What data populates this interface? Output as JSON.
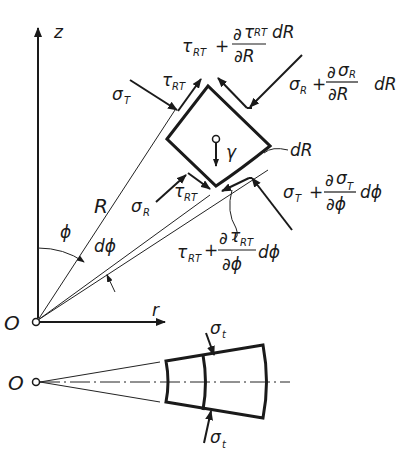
{
  "diagram": {
    "axes": {
      "z_label": "z",
      "r_label": "r",
      "origin_label": "O"
    },
    "radius_label": "R",
    "angle_label": "ϕ",
    "dangle_label": "dϕ",
    "body_force_label": "γ",
    "element_width_label": "dR",
    "stresses": {
      "sigma_T": {
        "main": "σ",
        "sub": "T"
      },
      "tau_RT_top_left": {
        "main": "τ",
        "sub": "RT"
      },
      "tau_RT_top": {
        "main": "τ",
        "sub": "RT",
        "plus": "+",
        "num_d": "∂",
        "num_main": "τ",
        "num_sub": "RT",
        "num_tail": "dR",
        "den": "∂R"
      },
      "sigma_R_top": {
        "main": "σ",
        "sub": "R",
        "plus": "+",
        "num_d": "∂",
        "num_main": "σ",
        "num_sub": "R",
        "den": "∂R",
        "tail": "dR"
      },
      "sigma_R": {
        "main": "σ",
        "sub": "R"
      },
      "tau_RT_bottom_left": {
        "main": "τ",
        "sub": "RT"
      },
      "sigma_T_right": {
        "main": "σ",
        "sub": "T",
        "plus": "+",
        "num_d": "∂",
        "num_main": "σ",
        "num_sub": "T",
        "den": "∂ϕ",
        "tail": "dϕ"
      },
      "tau_RT_bottom": {
        "main": "τ",
        "sub": "RT",
        "plus": "+",
        "num_d": "∂",
        "num_main": "τ",
        "num_sub": "RT",
        "den": "∂ϕ",
        "tail": "dϕ"
      }
    },
    "lower_view": {
      "origin_label": "O",
      "sigma_t_top": {
        "main": "σ",
        "sub": "t"
      },
      "sigma_t_bottom": {
        "main": "σ",
        "sub": "t"
      }
    }
  }
}
